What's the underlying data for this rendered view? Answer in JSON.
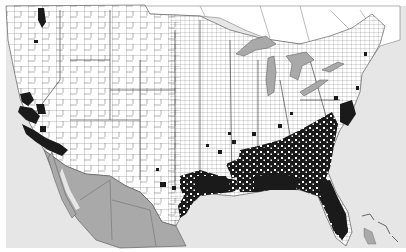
{
  "map": {
    "type": "county distribution map",
    "region": "Contiguous United States with southern Canada and northern Mexico",
    "colors": {
      "ocean": "#e6e6e6",
      "land": "#ffffff",
      "foreign_land": "#a9a9a9",
      "lakes": "#a9a9a9",
      "county_borders": "#555555",
      "present": "#1a1a1a"
    },
    "legend": {
      "present_label": "present",
      "absent_label": "absent"
    },
    "occupied_regions": [
      "Pacific Northwest coast (Puget Sound)",
      "California coast and Central Valley",
      "Southern California",
      "Central/South Texas",
      "Gulf Coast (Texas, Louisiana, Mississippi, Alabama)",
      "Florida",
      "Georgia, South Carolina, North Carolina coastal plain",
      "Chesapeake Bay / Mid-Atlantic coast",
      "Scattered counties in Arkansas, Tennessee, Oklahoma"
    ]
  }
}
